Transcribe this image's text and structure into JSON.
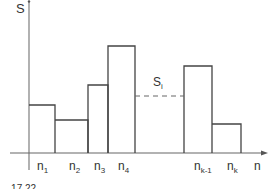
{
  "diagram": {
    "y_axis_label": "S",
    "x_axis_label": "n",
    "segment_label": "S",
    "segment_label_sub": "i",
    "colors": {
      "line": "#444444",
      "axis": "#777777",
      "text": "#333333",
      "dash": "#666666"
    },
    "bars": [
      {
        "label": "n",
        "sub": "1"
      },
      {
        "label": "n",
        "sub": "2"
      },
      {
        "label": "n",
        "sub": "3"
      },
      {
        "label": "n",
        "sub": "4"
      },
      {
        "label": "n",
        "sub": "k-1"
      },
      {
        "label": "n",
        "sub": "k"
      }
    ],
    "caption": "... 17.22 ..."
  }
}
